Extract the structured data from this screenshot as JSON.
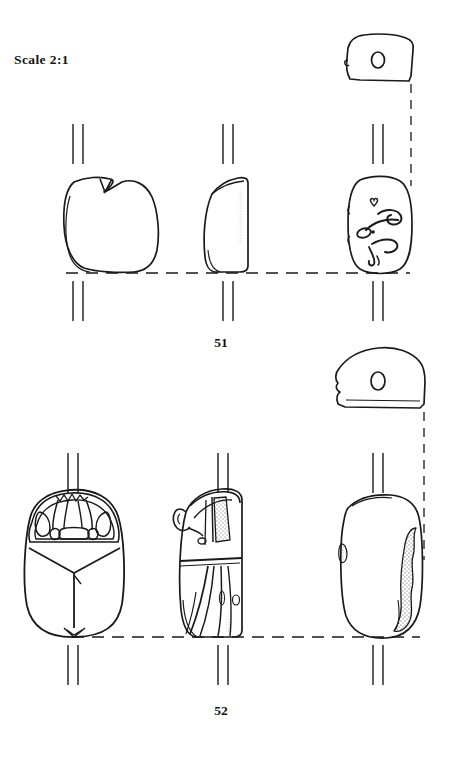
{
  "plate": {
    "scale_label": "Scale 2:1",
    "background_color": "#ffffff",
    "ink_color": "#1a1a1a",
    "width": 451,
    "height": 759
  },
  "figures": [
    {
      "number": "51",
      "object_type": "scarab-seal",
      "views": [
        {
          "view": "section",
          "position": "top-right",
          "description": "trapezoidal longitudinal section with central circular piercing hole"
        },
        {
          "view": "dorsal",
          "position": "left",
          "description": "plain rounded oval back with small V-notch at head end"
        },
        {
          "view": "profile",
          "position": "centre",
          "description": "angular side profile with flat vertical right edge"
        },
        {
          "view": "base",
          "position": "right",
          "description": "engraved base with curvilinear scroll motifs and small heart-shaped sign"
        }
      ]
    },
    {
      "number": "52",
      "object_type": "scarab-seal",
      "views": [
        {
          "view": "section",
          "position": "upper-right",
          "description": "domed section with notched left edge and oval piercing hole"
        },
        {
          "view": "dorsal",
          "position": "left",
          "description": "scarab beetle back with detailed clypeus, pronotum cells and divided elytra"
        },
        {
          "view": "profile",
          "position": "centre",
          "description": "side view with legs, stippled shading and flat base"
        },
        {
          "view": "base",
          "position": "right",
          "description": "plain uninscribed base with stippled damage along right edge"
        }
      ]
    }
  ]
}
